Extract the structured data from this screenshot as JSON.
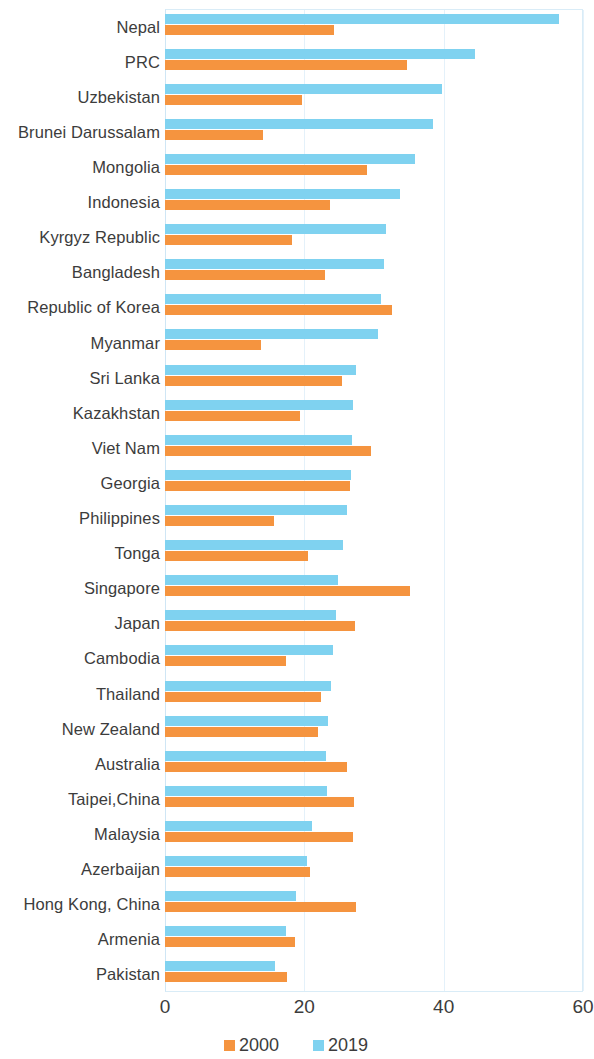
{
  "chart_data": {
    "type": "bar",
    "orientation": "horizontal",
    "title": "",
    "subtitle": "",
    "xlabel": "",
    "ylabel": "",
    "xlim": [
      0,
      60
    ],
    "xticks": [
      0,
      20,
      40,
      60
    ],
    "xtick_labels": [
      "0",
      "20",
      "40",
      "60"
    ],
    "grid": true,
    "grid_axis": "x",
    "legend_position": "bottom",
    "categories": [
      "Nepal",
      "PRC",
      "Uzbekistan",
      "Brunei Darussalam",
      "Mongolia",
      "Indonesia",
      "Kyrgyz Republic",
      "Bangladesh",
      "Republic of Korea",
      "Myanmar",
      "Sri Lanka",
      "Kazakhstan",
      "Viet Nam",
      "Georgia",
      "Philippines",
      "Tonga",
      "Singapore",
      "Japan",
      "Cambodia",
      "Thailand",
      "New Zealand",
      "Australia",
      "Taipei,China",
      "Malaysia",
      "Azerbaijan",
      "Hong Kong, China",
      "Armenia",
      "Pakistan"
    ],
    "series": [
      {
        "name": "2019",
        "color": "#7fd2f0",
        "values": [
          56.6,
          44.5,
          39.7,
          38.5,
          35.9,
          33.7,
          31.7,
          31.4,
          31.0,
          30.6,
          27.4,
          27.0,
          26.8,
          26.7,
          26.1,
          25.5,
          24.9,
          24.6,
          24.1,
          23.8,
          23.4,
          23.1,
          23.2,
          21.1,
          20.4,
          18.8,
          17.4,
          15.8
        ]
      },
      {
        "name": "2000",
        "color": "#f5943f",
        "values": [
          24.3,
          34.7,
          19.6,
          14.0,
          29.0,
          23.7,
          18.2,
          23.0,
          32.6,
          13.8,
          25.4,
          19.4,
          29.6,
          26.6,
          15.6,
          20.5,
          35.2,
          27.3,
          17.4,
          22.4,
          21.9,
          26.1,
          27.2,
          27.0,
          20.8,
          27.4,
          18.7,
          17.5
        ]
      }
    ],
    "legend": [
      {
        "label": "2000",
        "color": "#f5943f"
      },
      {
        "label": "2019",
        "color": "#7fd2f0"
      }
    ]
  }
}
